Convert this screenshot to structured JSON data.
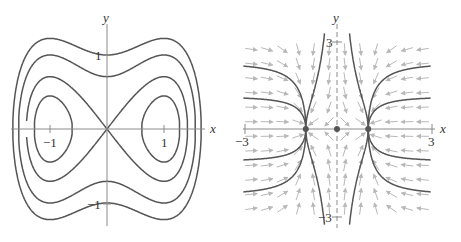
{
  "chart_data": [
    {
      "type": "line",
      "title": "",
      "subtitle": "Level curves of H(x,y) = y^2/2 - x^2/2 + x^4/4",
      "xlabel": "x",
      "ylabel": "y",
      "xlim": [
        -1.75,
        1.85
      ],
      "ylim": [
        -1.3,
        1.4
      ],
      "grid": false,
      "legend": null,
      "x_ticks": [
        {
          "value": -1,
          "label": "−1"
        },
        {
          "value": 1,
          "label": "1"
        }
      ],
      "y_ticks": [
        {
          "value": 1,
          "label": "1"
        },
        {
          "value": -1,
          "label": "−1"
        }
      ],
      "level_values": [
        -0.15,
        0.0,
        0.25,
        0.5
      ],
      "series": [
        {
          "name": "inner oval (left)",
          "level": -0.15,
          "x_intercepts": [
            -1.28,
            -0.61
          ]
        },
        {
          "name": "inner oval (right)",
          "level": -0.15,
          "x_intercepts": [
            0.61,
            1.28
          ]
        },
        {
          "name": "separatrix (figure eight)",
          "level": 0.0,
          "x_intercepts": [
            -1.414,
            0,
            1.414
          ]
        },
        {
          "name": "closed orbit",
          "level": 0.25,
          "x_intercepts": [
            -1.554,
            1.554
          ],
          "y_intercepts": [
            -0.707,
            0.707
          ]
        },
        {
          "name": "outer closed orbit",
          "level": 0.5,
          "x_intercepts": [
            -1.653,
            1.653
          ],
          "y_intercepts": [
            -1.0,
            1.0
          ]
        }
      ],
      "annotations": [
        "x",
        "y",
        "−1",
        "1",
        "1",
        "−1"
      ]
    },
    {
      "type": "line",
      "title": "",
      "subtitle": "Phase portrait of x' = x - x^3, y' = -y with direction field",
      "xlabel": "x",
      "ylabel": "y",
      "xlim": [
        -3,
        3
      ],
      "ylim": [
        -3.2,
        3.3
      ],
      "grid": false,
      "legend": null,
      "x_ticks": [
        {
          "value": -3,
          "label": "−3"
        },
        {
          "value": 3,
          "label": "3"
        }
      ],
      "y_ticks": [
        {
          "value": 3,
          "label": "3"
        },
        {
          "value": -3,
          "label": "−3"
        }
      ],
      "equilibria": [
        {
          "x": -1,
          "y": 0
        },
        {
          "x": 0,
          "y": 0
        },
        {
          "x": 1,
          "y": 0
        }
      ],
      "trajectory_formula": "y = C * sqrt(|1 - x^2|) / |x|",
      "series": [
        {
          "name": "outer upper-left",
          "C": 2.3,
          "x_range": [
            -3,
            -1
          ],
          "sign": 1
        },
        {
          "name": "outer upper-left 2",
          "C": 1.13,
          "x_range": [
            -3,
            -1
          ],
          "sign": 1
        },
        {
          "name": "outer lower-left",
          "C": 1.13,
          "x_range": [
            -3,
            -1
          ],
          "sign": -1
        },
        {
          "name": "outer lower-left 2",
          "C": 2.3,
          "x_range": [
            -3,
            -1
          ],
          "sign": -1
        },
        {
          "name": "outer upper-right",
          "C": 2.3,
          "x_range": [
            1,
            3
          ],
          "sign": 1
        },
        {
          "name": "outer upper-right 2",
          "C": 1.13,
          "x_range": [
            1,
            3
          ],
          "sign": 1
        },
        {
          "name": "outer lower-right",
          "C": 1.13,
          "x_range": [
            1,
            3
          ],
          "sign": -1
        },
        {
          "name": "outer lower-right 2",
          "C": 2.3,
          "x_range": [
            1,
            3
          ],
          "sign": -1
        },
        {
          "name": "inner upper-left",
          "C": 1.44,
          "x_range": [
            -1,
            -0.4
          ],
          "sign": 1
        },
        {
          "name": "inner lower-left",
          "C": 1.44,
          "x_range": [
            -1,
            -0.4
          ],
          "sign": -1
        },
        {
          "name": "inner upper-right",
          "C": 1.44,
          "x_range": [
            0.4,
            1
          ],
          "sign": 1
        },
        {
          "name": "inner lower-right",
          "C": 1.44,
          "x_range": [
            0.4,
            1
          ],
          "sign": -1
        }
      ],
      "direction_field": {
        "x_step": 0.5,
        "y_step": 0.5,
        "color": "#b8b8b8"
      },
      "annotations": [
        "x",
        "y",
        "−3",
        "3",
        "3",
        "−3"
      ]
    }
  ],
  "labels": {
    "left": {
      "x_axis": "x",
      "y_axis": "y",
      "tick_x_neg": "−1",
      "tick_x_pos": "1",
      "tick_y_pos": "1",
      "tick_y_neg": "−1"
    },
    "right": {
      "x_axis": "x",
      "y_axis": "y",
      "tick_x_neg": "−3",
      "tick_x_pos": "3",
      "tick_y_pos": "3",
      "tick_y_neg": "−3"
    }
  },
  "colors": {
    "curve": "#555555",
    "axis": "#8a8a8a",
    "field": "#b8b8b8",
    "dot": "#555555"
  }
}
